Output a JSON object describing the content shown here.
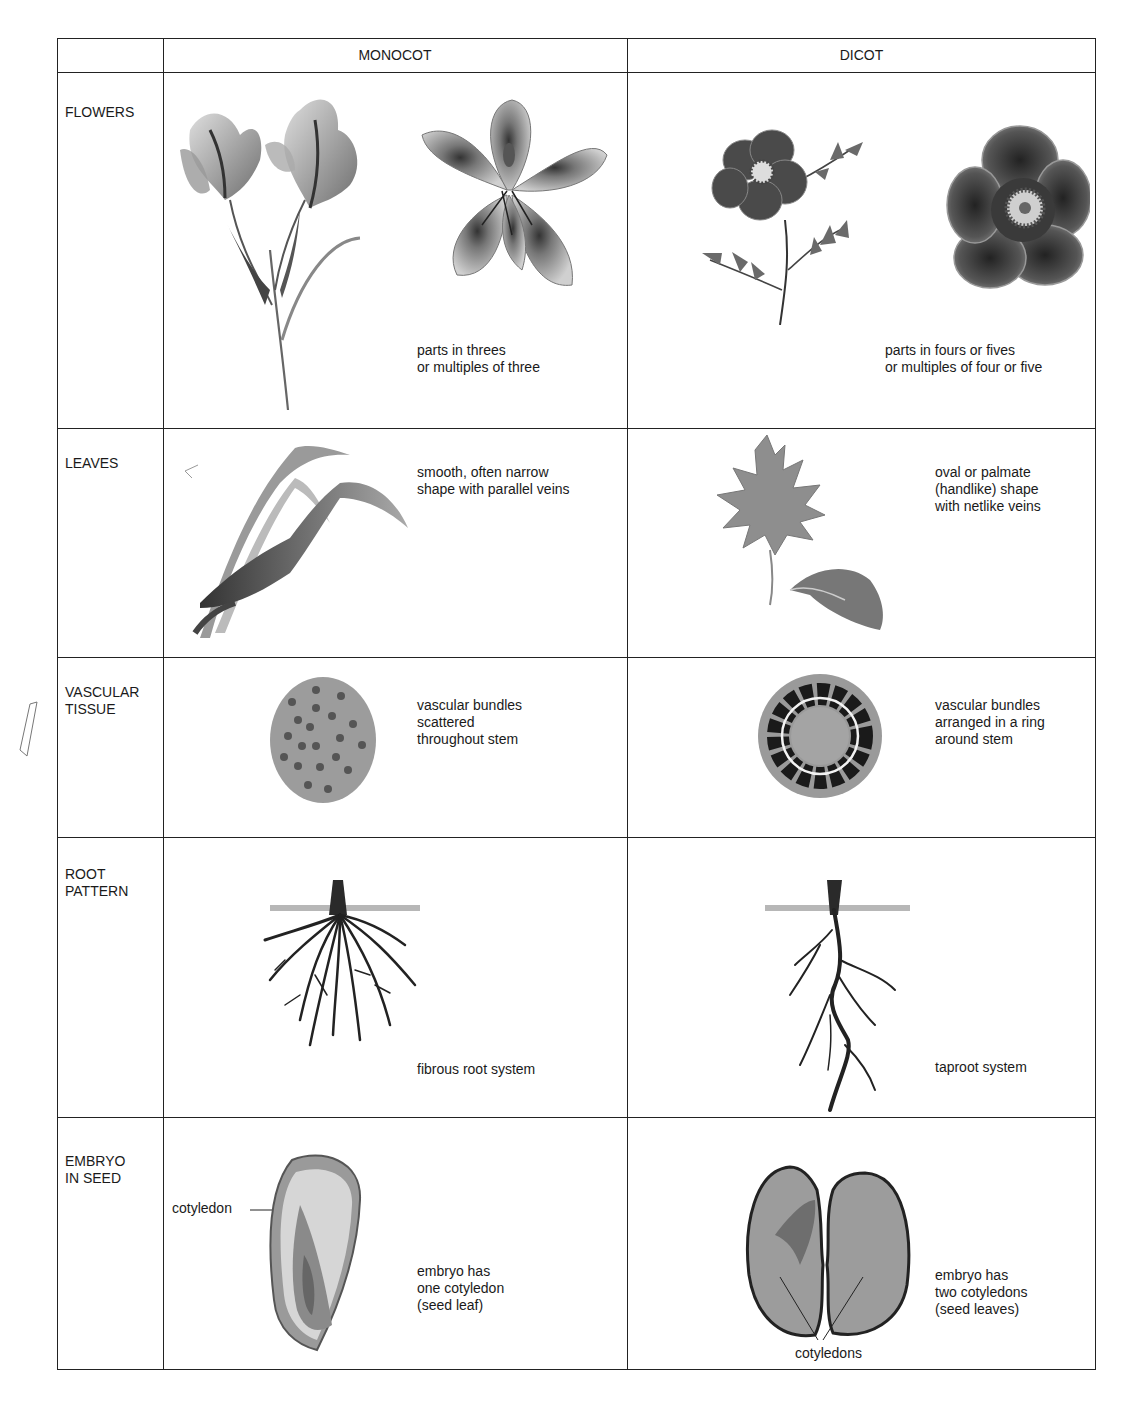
{
  "table": {
    "columns": [
      "",
      "MONOCOT",
      "DICOT"
    ],
    "rows": [
      {
        "label": [
          "FLOWERS"
        ],
        "monocot": {
          "caption": [
            "parts in threes",
            "or multiples of three"
          ],
          "illustration": "iris-flower-illustration"
        },
        "dicot": {
          "caption": [
            "parts in fours or fives",
            "or multiples of four or five"
          ],
          "illustration": "rose-flower-illustration"
        }
      },
      {
        "label": [
          "LEAVES"
        ],
        "monocot": {
          "caption": [
            "smooth, often narrow",
            "shape with parallel veins"
          ],
          "illustration": "narrow-leaf-illustration"
        },
        "dicot": {
          "caption": [
            "oval or palmate",
            "(handlike) shape",
            "with netlike veins"
          ],
          "illustration": "palmate-and-oval-leaf-illustration"
        }
      },
      {
        "label": [
          "VASCULAR",
          "TISSUE"
        ],
        "monocot": {
          "caption": [
            "vascular bundles",
            "scattered",
            "throughout stem"
          ],
          "illustration": "scattered-bundles-stem-cross-section"
        },
        "dicot": {
          "caption": [
            "vascular bundles",
            "arranged in a ring",
            "around stem"
          ],
          "illustration": "ring-bundles-stem-cross-section"
        }
      },
      {
        "label": [
          "ROOT",
          "PATTERN"
        ],
        "monocot": {
          "caption": [
            "fibrous root system"
          ],
          "illustration": "fibrous-root-illustration"
        },
        "dicot": {
          "caption": [
            "taproot system"
          ],
          "illustration": "taproot-illustration"
        }
      },
      {
        "label": [
          "EMBRYO",
          "IN SEED"
        ],
        "monocot": {
          "caption": [
            "embryo has",
            "one cotyledon",
            "(seed leaf)"
          ],
          "callout": "cotyledon",
          "illustration": "monocot-seed-cross-section"
        },
        "dicot": {
          "caption": [
            "embryo has",
            "two cotyledons",
            "(seed leaves)"
          ],
          "callout": "cotyledons",
          "illustration": "dicot-seed-cross-section"
        }
      }
    ]
  },
  "colors": {
    "line": "#222222",
    "text": "#1a1a1a",
    "illustration_dark": "#2a2a2a",
    "illustration_mid": "#8a8a8a",
    "illustration_light": "#c8c8c8"
  }
}
